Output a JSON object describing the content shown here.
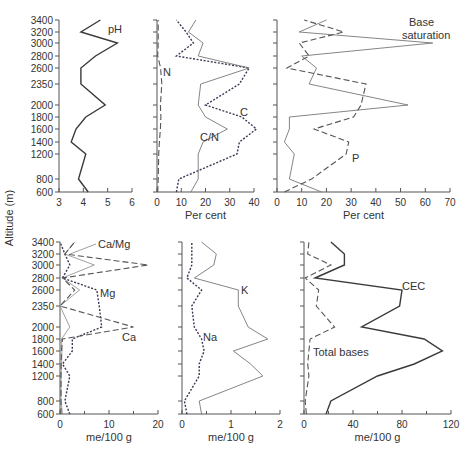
{
  "figure": {
    "ylabel": "Altitude (m)",
    "altitudes": [
      600,
      800,
      1200,
      1400,
      1600,
      1800,
      2000,
      2350,
      2600,
      2800,
      3000,
      3200,
      3400
    ],
    "ytick_labels": [
      "600",
      "800",
      "1200",
      "1400",
      "1600",
      "1800",
      "2000",
      "2350",
      "2600",
      "2800",
      "3000",
      "3200",
      "3400"
    ]
  },
  "chart_data": [
    {
      "type": "line",
      "panel": "top-left",
      "title": "",
      "xlabel": "",
      "ylabel": "Altitude (m)",
      "xlim": [
        3,
        6
      ],
      "xticks": [
        3,
        4,
        5,
        6
      ],
      "y": [
        600,
        800,
        1200,
        1400,
        1600,
        1800,
        2000,
        2350,
        2600,
        2800,
        3000,
        3200,
        3400
      ],
      "series": [
        {
          "name": "pH",
          "style": "solid-thick",
          "values": [
            4.2,
            3.8,
            4.1,
            3.5,
            3.7,
            4.1,
            4.9,
            3.9,
            3.9,
            4.5,
            5.4,
            3.9,
            4.7
          ]
        }
      ]
    },
    {
      "type": "line",
      "panel": "top-middle",
      "xlabel": "Per cent",
      "xlim": [
        0,
        40
      ],
      "xticks": [
        0,
        10,
        20,
        30,
        40
      ],
      "y": [
        600,
        800,
        1200,
        1400,
        1600,
        1800,
        2000,
        2350,
        2600,
        2800,
        3000,
        3200,
        3400
      ],
      "series": [
        {
          "name": "N",
          "style": "dashed",
          "values": [
            0.3,
            0.5,
            0.7,
            1.0,
            1.4,
            1.6,
            1.4,
            2.0,
            1.5,
            0.3,
            0.5,
            0.5,
            0.5
          ]
        },
        {
          "name": "C",
          "style": "dotted",
          "values": [
            8,
            9,
            33,
            34,
            41,
            35,
            20,
            34,
            38,
            8,
            15,
            12,
            8
          ]
        },
        {
          "name": "C/N",
          "style": "solid",
          "values": [
            14,
            17,
            17,
            19,
            29,
            20,
            17,
            18,
            38,
            17,
            19,
            13,
            16
          ]
        }
      ]
    },
    {
      "type": "line",
      "panel": "top-right",
      "xlabel": "Per cent",
      "xlim": [
        0,
        70
      ],
      "xticks": [
        0,
        10,
        20,
        30,
        40,
        50,
        60,
        70
      ],
      "y": [
        600,
        800,
        1200,
        1400,
        1600,
        1800,
        2000,
        2350,
        2600,
        2800,
        3000,
        3200,
        3400
      ],
      "series": [
        {
          "name": "Base saturation",
          "style": "solid",
          "values": [
            18,
            5,
            7,
            3,
            5,
            5,
            53,
            13,
            16,
            10,
            63,
            9,
            20
          ]
        },
        {
          "name": "P",
          "style": "dashed",
          "values": [
            3,
            14,
            28,
            29,
            15,
            31,
            34,
            36,
            4,
            13,
            9,
            27,
            11
          ]
        }
      ]
    },
    {
      "type": "line",
      "panel": "bottom-left",
      "xlabel": "me/100 g",
      "ylabel": "Altitude (m)",
      "xlim": [
        0,
        20
      ],
      "xticks": [
        0,
        10,
        20
      ],
      "y": [
        600,
        800,
        1200,
        1400,
        1600,
        1800,
        2000,
        2350,
        2600,
        2800,
        3000,
        3200,
        3400
      ],
      "series": [
        {
          "name": "Ca/Mg",
          "style": "solid-thin",
          "values": [
            0.5,
            0.2,
            0.2,
            0.3,
            0.4,
            0.3,
            2,
            0,
            4,
            0.5,
            7,
            1,
            3
          ]
        },
        {
          "name": "Mg",
          "style": "dotted",
          "values": [
            2,
            1,
            2,
            0.5,
            2.5,
            2.5,
            8.5,
            8,
            7.5,
            0.5,
            2,
            1,
            0
          ]
        },
        {
          "name": "Ca",
          "style": "dashed",
          "values": [
            0.2,
            0.2,
            0.2,
            0.2,
            0.3,
            0.5,
            15,
            0,
            3,
            0.5,
            18,
            1,
            3
          ]
        }
      ]
    },
    {
      "type": "line",
      "panel": "bottom-middle",
      "xlabel": "me/100 g",
      "xlim": [
        0,
        2
      ],
      "xticks": [
        0,
        1,
        2
      ],
      "y": [
        600,
        800,
        1200,
        1400,
        1600,
        1800,
        2000,
        2350,
        2600,
        2800,
        3000,
        3200,
        3400
      ],
      "series": [
        {
          "name": "K",
          "style": "solid",
          "values": [
            0.4,
            0.35,
            1.65,
            1.4,
            1.05,
            1.75,
            1.35,
            1.15,
            1.15,
            0.25,
            0.65,
            0.7,
            0.4
          ]
        },
        {
          "name": "Na",
          "style": "dotted",
          "values": [
            0.1,
            0.05,
            0.35,
            0.35,
            0.45,
            0.4,
            0.25,
            0.2,
            0.4,
            0.1,
            0.2,
            0.2,
            0.2
          ]
        }
      ]
    },
    {
      "type": "line",
      "panel": "bottom-right",
      "xlabel": "me/100 g",
      "xlim": [
        0,
        120
      ],
      "xticks": [
        0,
        40,
        80,
        120
      ],
      "y": [
        600,
        800,
        1200,
        1400,
        1600,
        1800,
        2000,
        2350,
        2600,
        2800,
        3000,
        3200,
        3400
      ],
      "series": [
        {
          "name": "CEC",
          "style": "solid-thick",
          "values": [
            18,
            22,
            60,
            90,
            113,
            98,
            47,
            78,
            80,
            9,
            33,
            33,
            22
          ]
        },
        {
          "name": "Total bases",
          "style": "dashed",
          "values": [
            2,
            1,
            4,
            3,
            4,
            5,
            25,
            10,
            12,
            1,
            22,
            3,
            4
          ]
        }
      ]
    }
  ],
  "labels": {
    "ylabel": "Altitude (m)",
    "pH": "pH",
    "N": "N",
    "C": "C",
    "CN": "C/N",
    "base_sat_1": "Base",
    "base_sat_2": "saturation",
    "P": "P",
    "CaMg": "Ca/Mg",
    "Mg": "Mg",
    "Ca": "Ca",
    "K": "K",
    "Na": "Na",
    "CEC": "CEC",
    "total_bases": "Total bases",
    "percent": "Per cent",
    "me100g": "me/100 g"
  },
  "colors": {
    "line": "#4a4a4a",
    "axis": "#555555",
    "text": "#333333"
  }
}
